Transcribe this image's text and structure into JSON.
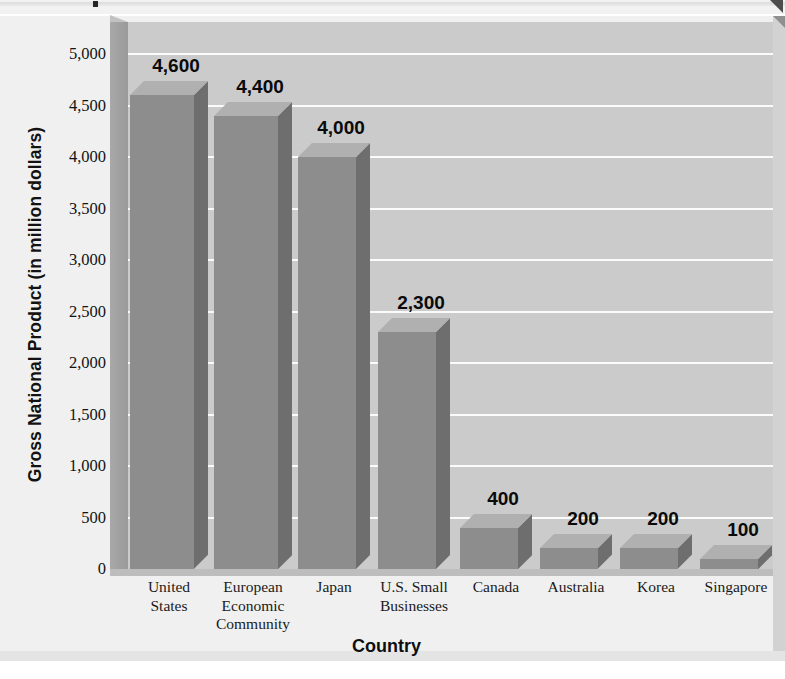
{
  "window": {
    "top_strip_present": true,
    "corner_arrow_icon": "triangle-corner-icon"
  },
  "chart_data": {
    "type": "bar",
    "title": "",
    "xlabel": "Country",
    "ylabel": "Gross National Product (in million dollars)",
    "categories": [
      "United States",
      "European Economic Community",
      "Japan",
      "U.S. Small Businesses",
      "Canada",
      "Australia",
      "Korea",
      "Singapore"
    ],
    "category_lines": [
      [
        "United",
        "States"
      ],
      [
        "European",
        "Economic",
        "Community"
      ],
      [
        "Japan"
      ],
      [
        "U.S. Small",
        "Businesses"
      ],
      [
        "Canada"
      ],
      [
        "Australia"
      ],
      [
        "Korea"
      ],
      [
        "Singapore"
      ]
    ],
    "values": [
      4600,
      4400,
      4000,
      2300,
      400,
      200,
      200,
      100
    ],
    "value_labels": [
      "4,600",
      "4,400",
      "4,000",
      "2,300",
      "400",
      "200",
      "200",
      "100"
    ],
    "ylim": [
      0,
      5000
    ],
    "ytick_values": [
      5000,
      4500,
      4000,
      3500,
      3000,
      2500,
      2000,
      1500,
      1000,
      500,
      0
    ],
    "ytick_labels": [
      "5,000",
      "4,500",
      "4,000",
      "3,500",
      "3,000",
      "2,500",
      "2,000",
      "1,500",
      "1,000",
      "500",
      "0"
    ],
    "grid": true,
    "gridline_color": "#fbfbfb",
    "legend": null,
    "style": "3d-bar",
    "colors": {
      "bar_front": "#8d8d8d",
      "bar_side": "#6e6e6e",
      "bar_top": "#b0b0b0",
      "plot_background": "#cbcbcb",
      "figure_background": "#efefef",
      "axis_wall": "#a0a0a0",
      "text": "#121212"
    }
  }
}
